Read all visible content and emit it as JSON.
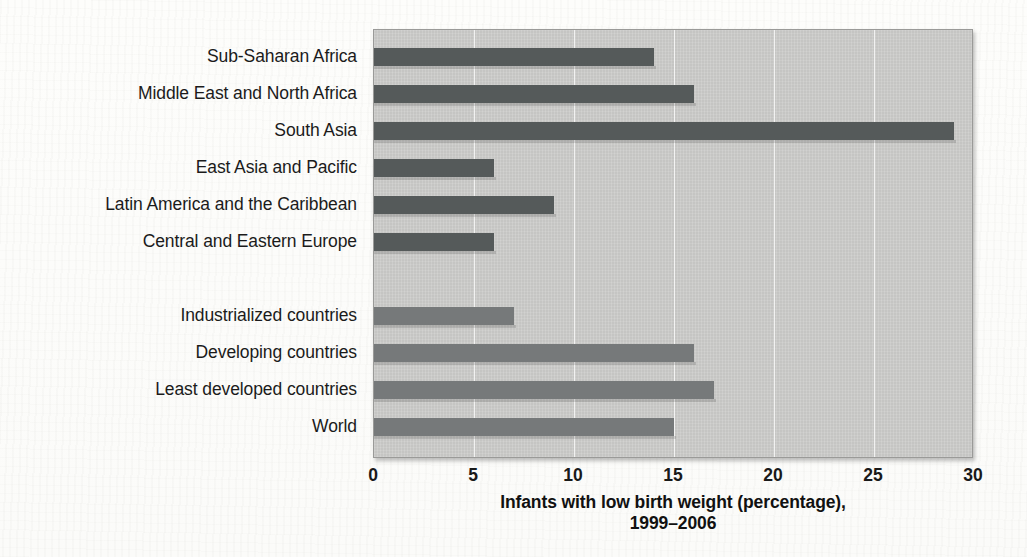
{
  "chart_data": {
    "type": "bar",
    "orientation": "horizontal",
    "title": "",
    "xlabel": "Infants with low birth weight (percentage), 1999–2006",
    "xlabel_line1": "Infants with low birth weight (percentage),",
    "xlabel_line2": "1999–2006",
    "ylabel": "",
    "xlim": [
      0,
      30
    ],
    "xticks": [
      0,
      5,
      10,
      15,
      20,
      25,
      30
    ],
    "xtick_labels": [
      "0",
      "5",
      "10",
      "15",
      "20",
      "25",
      "30"
    ],
    "grid": "vertical",
    "legend": "none",
    "categories": [
      "Sub-Saharan Africa",
      "Middle East and North Africa",
      "South Asia",
      "East Asia and Pacific",
      "Latin America and the Caribbean",
      "Central and Eastern Europe",
      "Industrialized countries",
      "Developing countries",
      "Least developed countries",
      "World"
    ],
    "values": [
      14,
      16,
      29,
      6,
      9,
      6,
      7,
      16,
      17,
      15
    ],
    "bars": [
      {
        "label": "Sub-Saharan Africa",
        "value": 14,
        "group": "regions",
        "color": "#555a5a",
        "row": 0
      },
      {
        "label": "Middle East and North Africa",
        "value": 16,
        "group": "regions",
        "color": "#555a5a",
        "row": 1
      },
      {
        "label": "South Asia",
        "value": 29,
        "group": "regions",
        "color": "#555a5a",
        "row": 2
      },
      {
        "label": "East Asia and Pacific",
        "value": 6,
        "group": "regions",
        "color": "#555a5a",
        "row": 3
      },
      {
        "label": "Latin America and the Caribbean",
        "value": 9,
        "group": "regions",
        "color": "#555a5a",
        "row": 4
      },
      {
        "label": "Central and Eastern Europe",
        "value": 6,
        "group": "regions",
        "color": "#555a5a",
        "row": 5
      },
      {
        "label": "Industrialized countries",
        "value": 7,
        "group": "aggregates",
        "color": "#76797a",
        "row": 7
      },
      {
        "label": "Developing countries",
        "value": 16,
        "group": "aggregates",
        "color": "#76797a",
        "row": 8
      },
      {
        "label": "Least developed countries",
        "value": 17,
        "group": "aggregates",
        "color": "#76797a",
        "row": 9
      },
      {
        "label": "World",
        "value": 15,
        "group": "aggregates",
        "color": "#76797a",
        "row": 10
      }
    ],
    "colors": {
      "regions_bar": "#555a5a",
      "aggregates_bar": "#76797a",
      "plot_background": "#c9c9c7",
      "gridline": "#ffffff",
      "text": "#1b1b1b"
    }
  }
}
